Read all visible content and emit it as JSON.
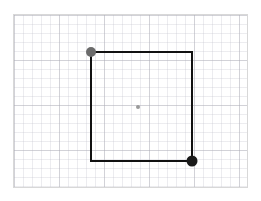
{
  "app": {
    "title": "Shape Editor Canvas",
    "background_color": "#ffffff"
  },
  "canvas": {
    "name": "drawing-canvas",
    "x": 13,
    "y": 14,
    "width": 235,
    "height": 174,
    "background_color": "#ffffff",
    "border_color": "#d8d8d8",
    "border_width": 1
  },
  "grid": {
    "visible": true,
    "minor_spacing": 9,
    "minor_color": "#c8c8d2",
    "major_spacing": 45,
    "major_color": "#aaaab4"
  },
  "shapes": [
    {
      "id": "rectangle-1",
      "name": "rectangle",
      "type": "rectangle",
      "stroke_color": "#111111",
      "stroke_width": 2.5,
      "fill": "none",
      "x": 77,
      "y": 37,
      "width": 101,
      "height": 109,
      "selected": true
    }
  ],
  "handles": [
    {
      "id": "handle-top-left",
      "name": "resize-handle-top-left",
      "label": "Top-left resize handle",
      "cx": 77,
      "cy": 37,
      "r": 5,
      "color": "#6b6b6b",
      "state": "idle"
    },
    {
      "id": "handle-bottom-right",
      "name": "resize-handle-bottom-right",
      "label": "Bottom-right resize handle",
      "cx": 178,
      "cy": 146,
      "r": 5.5,
      "color": "#1a1a1a",
      "state": "active"
    }
  ],
  "center_marker": {
    "id": "center-dot",
    "name": "shape-center-marker",
    "label": "Shape center point",
    "cx": 124,
    "cy": 92,
    "r": 2,
    "color": "#9a9a9a"
  }
}
